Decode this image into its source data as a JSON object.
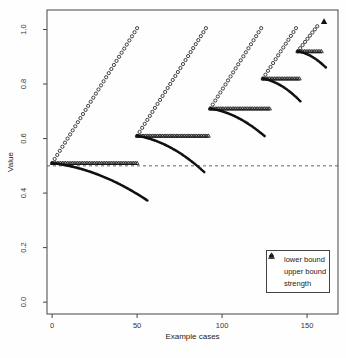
{
  "chart_data": {
    "type": "scatter",
    "title": "",
    "xlabel": "Example cases",
    "ylabel": "Value",
    "grid": false,
    "xlim": [
      -3,
      168.2
    ],
    "ylim": [
      -0.0435,
      1.0716
    ],
    "xticks": [
      {
        "value": 0,
        "label": "0"
      },
      {
        "value": 50,
        "label": "50"
      },
      {
        "value": 100,
        "label": "100"
      },
      {
        "value": 150,
        "label": "150"
      }
    ],
    "yticks": [
      {
        "value": 0.0,
        "label": "0.0"
      },
      {
        "value": 0.2,
        "label": "0.2"
      },
      {
        "value": 0.4,
        "label": "0.4"
      },
      {
        "value": 0.6,
        "label": "0.6"
      },
      {
        "value": 0.8,
        "label": "0.8"
      },
      {
        "value": 1.0,
        "label": "1.0"
      }
    ],
    "reference_line": {
      "value": 0.5,
      "style": "dashed"
    },
    "legend": {
      "position": "bottom-right",
      "entries": [
        {
          "symbol": "filled-circle",
          "label": "lower bound"
        },
        {
          "symbol": "open-circle",
          "label": "upper bound"
        },
        {
          "symbol": "open-triangle",
          "label": "strength"
        }
      ]
    },
    "series_model": "fans: at each segment the strength stays constant, the upper bound rises linearly to 1.0 and the lower bound decays in a convex curve",
    "fans": [
      {
        "x_start": 0,
        "strength": 0.51,
        "x_end": 50,
        "upper_peak": 1.005,
        "lower_end_value": 0.373,
        "lower_x_end": 56,
        "strength_x_end": 50
      },
      {
        "x_start": 50,
        "strength": 0.61,
        "x_end": 90.5,
        "upper_peak": 1.005,
        "lower_end_value": 0.477,
        "lower_x_end": 89.5,
        "strength_x_end": 92
      },
      {
        "x_start": 93,
        "strength": 0.71,
        "x_end": 123,
        "upper_peak": 1.005,
        "lower_end_value": 0.609,
        "lower_x_end": 125,
        "strength_x_end": 128
      },
      {
        "x_start": 124,
        "strength": 0.82,
        "x_end": 143.5,
        "upper_peak": 1.005,
        "lower_end_value": 0.737,
        "lower_x_end": 146,
        "strength_x_end": 145.5
      },
      {
        "x_start": 144.5,
        "strength": 0.92,
        "x_end": 156,
        "upper_peak": 1.012,
        "lower_end_value": 0.861,
        "lower_x_end": 161,
        "strength_x_end": 158.5
      }
    ],
    "final_marker": {
      "x": 160,
      "value": 1.03,
      "symbol": "filled-triangle"
    }
  }
}
